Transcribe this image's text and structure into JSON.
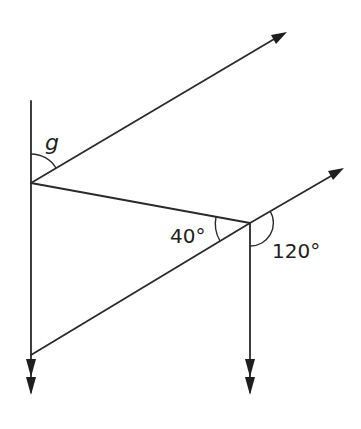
{
  "diagram": {
    "type": "geometry-parallel-lines-angles",
    "labels": {
      "unknown_angle": "g",
      "angle_a": "40°",
      "angle_b": "120°"
    },
    "colors": {
      "line": "#2a2a2a",
      "background": "#ffffff"
    }
  }
}
